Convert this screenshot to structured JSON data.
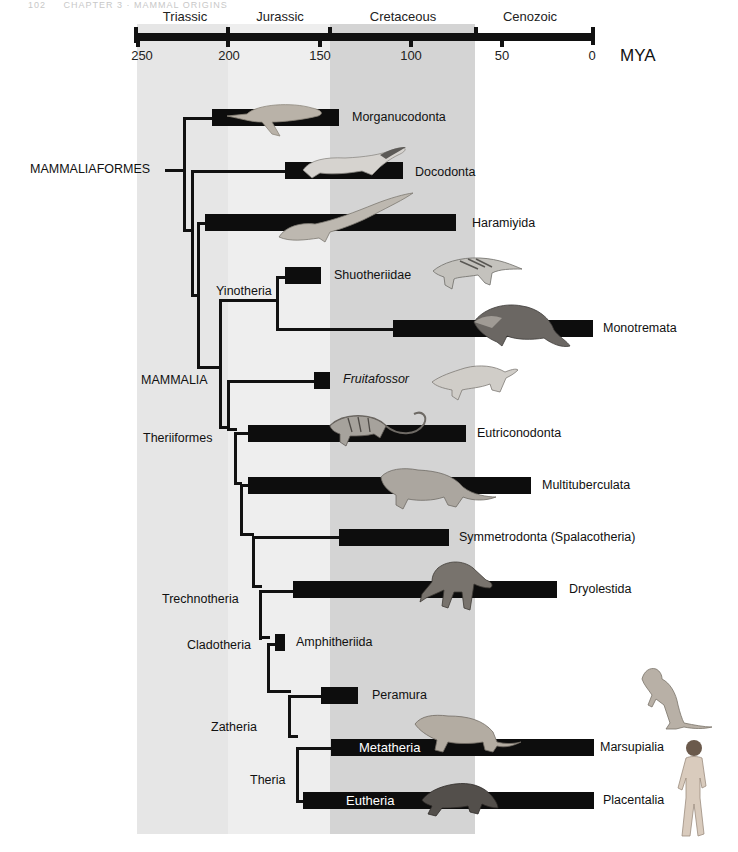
{
  "page_header": {
    "number": "102",
    "chapter": "CHAPTER 3 · MAMMAL ORIGINS"
  },
  "timescale": {
    "unit_label": "MYA",
    "ticks": [
      {
        "value": "250",
        "x": 137
      },
      {
        "value": "200",
        "x": 228
      },
      {
        "value": "150",
        "x": 320
      },
      {
        "value": "100",
        "x": 411
      },
      {
        "value": "50",
        "x": 502
      },
      {
        "value": "0",
        "x": 593
      }
    ],
    "periods": [
      {
        "name": "Triassic",
        "start": 251,
        "end": 201,
        "color": "#e6e6e6"
      },
      {
        "name": "Jurassic",
        "start": 201,
        "end": 145,
        "color": "#eeeeee"
      },
      {
        "name": "Cretaceous",
        "start": 145,
        "end": 66,
        "color": "#d4d4d4"
      },
      {
        "name": "Cenozoic",
        "start": 66,
        "end": 0,
        "color": "#ffffff"
      }
    ]
  },
  "clades": {
    "mammaliaformes": "MAMMALIAFORMES",
    "mammalia": "MAMMALIA",
    "yinotheria": "Yinotheria",
    "theriiformes": "Theriiformes",
    "trechnotheria": "Trechnotheria",
    "cladotheria": "Cladotheria",
    "zatheria": "Zatheria",
    "theria": "Theria"
  },
  "taxa": [
    {
      "name": "Morganucodonta",
      "start_mya": 205,
      "end_mya": 140,
      "animal": "morganucodon-icon"
    },
    {
      "name": "Docodonta",
      "start_mya": 167,
      "end_mya": 103,
      "animal": "docodont-icon"
    },
    {
      "name": "Haramiyida",
      "start_mya": 208,
      "end_mya": 75,
      "animal": "haramiyid-icon"
    },
    {
      "name": "Shuotheriidae",
      "start_mya": 166,
      "end_mya": 148,
      "animal": "shuotherium-icon"
    },
    {
      "name": "Monotremata",
      "start_mya": 110,
      "end_mya": 0,
      "animal": "platypus-icon"
    },
    {
      "name": "Fruitafossor",
      "start_mya": 152,
      "end_mya": 144,
      "italic": true,
      "animal": "fruitafossor-icon"
    },
    {
      "name": "Eutriconodonta",
      "start_mya": 185,
      "end_mya": 70,
      "animal": "eutriconodont-icon"
    },
    {
      "name": "Multituberculata",
      "start_mya": 185,
      "end_mya": 35,
      "animal": "multituberculate-icon"
    },
    {
      "name": "Symmetrodonta (Spalacotheria)",
      "start_mya": 140,
      "end_mya": 80,
      "animal": null
    },
    {
      "name": "Dryolestida",
      "start_mya": 163,
      "end_mya": 20,
      "animal": "dryolestid-icon"
    },
    {
      "name": "Amphitheriida",
      "start_mya": 168,
      "end_mya": 164,
      "animal": null
    },
    {
      "name": "Peramura",
      "start_mya": 145,
      "end_mya": 125,
      "animal": null
    },
    {
      "name": "Marsupialia",
      "start_mya": 145,
      "end_mya": 0,
      "bar_label": "Metatheria",
      "animal": "metatherian-icon"
    },
    {
      "name": "Placentalia",
      "start_mya": 160,
      "end_mya": 0,
      "bar_label": "Eutheria",
      "animal": "eutherian-icon"
    }
  ],
  "extant_icons": {
    "marsupialia": "kangaroo-icon",
    "placentalia": "human-icon"
  }
}
